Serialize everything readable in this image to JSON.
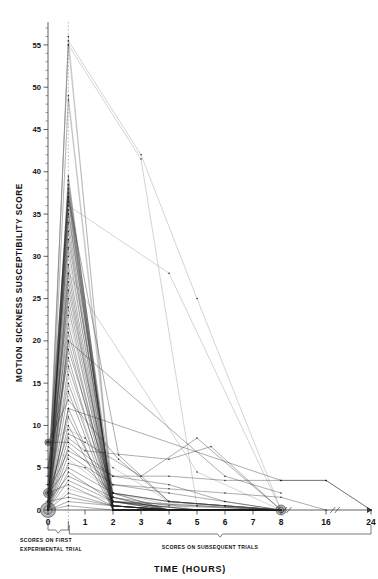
{
  "figure": {
    "axis_title_x": "TIME (HOURS)",
    "axis_title_y": "MOTION SICKNESS SUSCEPTIBILITY SCORE",
    "caption_left_line1": "SCORES ON FIRST",
    "caption_left_line2": "EXPERIMENTAL TRIAL",
    "caption_right": "SCORES ON SUBSEQUENT TRIALS",
    "colors": {
      "ink": "#1d1d1d",
      "light_ink": "#6a6a6a",
      "axis": "#3a3a3a",
      "guide": "#999999"
    }
  },
  "chart_data": {
    "type": "line",
    "title": "",
    "subtitle": "",
    "xlabel": "TIME (HOURS)",
    "ylabel": "MOTION SICKNESS SUSCEPTIBILITY SCORE",
    "grid": false,
    "legend_position": "none",
    "xlim": [
      0,
      24
    ],
    "ylim": [
      0,
      57
    ],
    "ytick_labels": [
      "0",
      "5",
      "10",
      "15",
      "20",
      "25",
      "30",
      "35",
      "40",
      "45",
      "50",
      "55"
    ],
    "yticks": [
      0,
      5,
      10,
      15,
      20,
      25,
      30,
      35,
      40,
      45,
      50,
      55
    ],
    "yminor_step": 1,
    "xtick_labels": [
      "0",
      "1",
      "2",
      "3",
      "4",
      "5",
      "6",
      "7",
      "8",
      "16",
      "24"
    ],
    "xticks": [
      0,
      1,
      2,
      3,
      4,
      5,
      6,
      7,
      8,
      16,
      24
    ],
    "x_axis_breaks": [
      [
        8.6,
        9.4
      ],
      [
        17.2,
        18.0
      ]
    ],
    "first_trial_x": 0.55,
    "annotations": [
      {
        "text": "SCORES ON FIRST EXPERIMENTAL TRIAL",
        "x_from": 0.0,
        "x_to": 0.55
      },
      {
        "text": "SCORES ON SUBSEQUENT TRIALS",
        "x_from": 0.55,
        "x_to": 24.0
      }
    ],
    "series": [
      {
        "name": "S01",
        "x": [
          0,
          0.55,
          2,
          4,
          6,
          8
        ],
        "values": [
          0,
          56,
          0,
          0,
          0,
          0
        ]
      },
      {
        "name": "S02",
        "x": [
          0,
          0.55,
          2,
          4,
          6,
          8
        ],
        "values": [
          1,
          55,
          1,
          0,
          0,
          0
        ]
      },
      {
        "name": "S03",
        "x": [
          0,
          0.55,
          3,
          5,
          8
        ],
        "values": [
          0,
          55.5,
          42,
          25,
          0
        ]
      },
      {
        "name": "S04",
        "x": [
          0,
          0.55,
          3,
          5,
          8
        ],
        "values": [
          2,
          55,
          41.5,
          0.5,
          0
        ]
      },
      {
        "name": "S05",
        "x": [
          0,
          0.55,
          2,
          4,
          8
        ],
        "values": [
          0,
          49,
          2,
          0,
          0
        ]
      },
      {
        "name": "S06",
        "x": [
          0,
          0.55,
          2,
          8
        ],
        "values": [
          0,
          48.5,
          1,
          0
        ]
      },
      {
        "name": "S07",
        "x": [
          0,
          0.55,
          2,
          4,
          6,
          8
        ],
        "values": [
          0,
          39.5,
          0,
          0,
          0,
          0
        ]
      },
      {
        "name": "S08",
        "x": [
          0,
          0.55,
          2,
          5,
          8
        ],
        "values": [
          1,
          39,
          0,
          0,
          0
        ]
      },
      {
        "name": "S09",
        "x": [
          0,
          0.55,
          2,
          4,
          8
        ],
        "values": [
          0,
          38.5,
          1.5,
          0,
          0
        ]
      },
      {
        "name": "S10",
        "x": [
          0,
          0.55,
          2,
          4,
          8
        ],
        "values": [
          3,
          38,
          0,
          0,
          0
        ]
      },
      {
        "name": "S11",
        "x": [
          0,
          0.55,
          2,
          4,
          8
        ],
        "values": [
          0,
          37.5,
          0.5,
          0,
          0
        ]
      },
      {
        "name": "S12",
        "x": [
          0,
          0.55,
          2,
          4,
          6,
          8
        ],
        "values": [
          0,
          37,
          0,
          0,
          0,
          0
        ]
      },
      {
        "name": "S13",
        "x": [
          0,
          0.55,
          2.2,
          4,
          8
        ],
        "values": [
          5,
          37,
          6.5,
          1,
          0
        ]
      },
      {
        "name": "S14",
        "x": [
          0,
          0.55,
          2,
          4,
          8
        ],
        "values": [
          0,
          36.5,
          0,
          0,
          0
        ]
      },
      {
        "name": "S15",
        "x": [
          0,
          0.55,
          4,
          8
        ],
        "values": [
          2,
          36,
          28,
          0
        ]
      },
      {
        "name": "S16",
        "x": [
          0,
          0.55,
          2,
          4,
          8
        ],
        "values": [
          0,
          35.5,
          0.5,
          0,
          0
        ]
      },
      {
        "name": "S17",
        "x": [
          0,
          0.55,
          2,
          5,
          8
        ],
        "values": [
          1,
          35,
          1,
          0,
          0
        ]
      },
      {
        "name": "S18",
        "x": [
          0,
          0.55,
          2,
          4,
          8
        ],
        "values": [
          0,
          34,
          0,
          0,
          0
        ]
      },
      {
        "name": "S19",
        "x": [
          0,
          0.55,
          2,
          4,
          6,
          8
        ],
        "values": [
          0,
          33,
          0,
          0,
          0,
          0
        ]
      },
      {
        "name": "S20",
        "x": [
          0,
          0.55,
          2,
          4,
          8
        ],
        "values": [
          4,
          32,
          1.5,
          0,
          0
        ]
      },
      {
        "name": "S21",
        "x": [
          0,
          0.55,
          2,
          4,
          8
        ],
        "values": [
          0,
          31,
          0,
          0,
          0
        ]
      },
      {
        "name": "S22",
        "x": [
          0,
          0.55,
          2,
          5,
          8
        ],
        "values": [
          2,
          30,
          2,
          0,
          0
        ]
      },
      {
        "name": "S23",
        "x": [
          0,
          0.55,
          2,
          4,
          8
        ],
        "values": [
          0,
          29,
          0.5,
          0,
          0
        ]
      },
      {
        "name": "S24",
        "x": [
          0,
          0.55,
          2,
          4,
          8
        ],
        "values": [
          0,
          28,
          0,
          0,
          0
        ]
      },
      {
        "name": "S25",
        "x": [
          0,
          0.55,
          2,
          4,
          6,
          8
        ],
        "values": [
          1,
          27,
          0,
          0,
          0,
          0
        ]
      },
      {
        "name": "S26",
        "x": [
          0,
          0.55,
          2,
          5,
          8
        ],
        "values": [
          0,
          26,
          1,
          0,
          0
        ]
      },
      {
        "name": "S27",
        "x": [
          0,
          0.55,
          2,
          4,
          8
        ],
        "values": [
          3,
          25,
          0.5,
          0,
          0
        ]
      },
      {
        "name": "S28",
        "x": [
          0,
          0.55,
          2,
          4,
          8
        ],
        "values": [
          0,
          24,
          0,
          0,
          0
        ]
      },
      {
        "name": "S29",
        "x": [
          0,
          0.55,
          2,
          4,
          8
        ],
        "values": [
          0,
          23,
          1,
          0,
          0
        ]
      },
      {
        "name": "S30",
        "x": [
          0,
          0.55,
          2,
          5,
          8
        ],
        "values": [
          2,
          22,
          0,
          0,
          0
        ]
      },
      {
        "name": "S31",
        "x": [
          0,
          0.55,
          2,
          4,
          8
        ],
        "values": [
          0,
          21,
          0.5,
          0,
          0
        ]
      },
      {
        "name": "S32",
        "x": [
          0,
          0.55,
          2,
          4,
          6,
          8
        ],
        "values": [
          1,
          20,
          0,
          0,
          0,
          0
        ]
      },
      {
        "name": "S33",
        "x": [
          0,
          0.55,
          2,
          4,
          8
        ],
        "values": [
          0,
          19,
          2,
          0,
          0
        ]
      },
      {
        "name": "S34",
        "x": [
          0,
          0.55,
          2,
          4,
          8
        ],
        "values": [
          5,
          18,
          0,
          0,
          0
        ]
      },
      {
        "name": "S35",
        "x": [
          0,
          0.55,
          2,
          4,
          8
        ],
        "values": [
          0,
          17,
          1,
          0,
          0
        ]
      },
      {
        "name": "S36",
        "x": [
          0,
          0.55,
          2,
          5,
          8
        ],
        "values": [
          0,
          16,
          0,
          0,
          0
        ]
      },
      {
        "name": "S37",
        "x": [
          0,
          0.55,
          2,
          4,
          8
        ],
        "values": [
          2,
          15,
          0.5,
          0,
          0
        ]
      },
      {
        "name": "S38",
        "x": [
          0,
          0.55,
          2,
          4,
          8
        ],
        "values": [
          0,
          14,
          0,
          0,
          0
        ]
      },
      {
        "name": "S39",
        "x": [
          0,
          0.55,
          2.2,
          4,
          8
        ],
        "values": [
          8,
          13,
          6,
          1,
          0
        ]
      },
      {
        "name": "S40",
        "x": [
          0,
          0.55,
          2,
          4,
          8
        ],
        "values": [
          0,
          12,
          0,
          0,
          0
        ]
      },
      {
        "name": "S41",
        "x": [
          0,
          0.55,
          2,
          5,
          8
        ],
        "values": [
          1,
          11,
          1,
          0,
          0
        ]
      },
      {
        "name": "S42",
        "x": [
          0,
          0.55,
          2,
          4,
          8
        ],
        "values": [
          0,
          10,
          0,
          0,
          0
        ]
      },
      {
        "name": "S43",
        "x": [
          0,
          0.55,
          1,
          2,
          4,
          8
        ],
        "values": [
          8,
          9.5,
          8.5,
          5,
          1,
          0
        ]
      },
      {
        "name": "S44",
        "x": [
          0,
          0.55,
          1,
          3,
          5,
          8
        ],
        "values": [
          2,
          9,
          8,
          4,
          8.5,
          0
        ]
      },
      {
        "name": "S45",
        "x": [
          0,
          0.55,
          1,
          4,
          5.5,
          8
        ],
        "values": [
          0,
          8.5,
          7,
          6,
          7.5,
          0
        ]
      },
      {
        "name": "S46",
        "x": [
          0,
          0.55,
          2,
          4,
          6,
          8
        ],
        "values": [
          8,
          8,
          4,
          3,
          1,
          0
        ]
      },
      {
        "name": "S47",
        "x": [
          0,
          0.55,
          2,
          4,
          6,
          8
        ],
        "values": [
          0,
          7.5,
          3,
          2,
          1,
          0
        ]
      },
      {
        "name": "S48",
        "x": [
          0,
          0.55,
          2,
          4,
          6,
          8,
          16,
          24
        ],
        "values": [
          2,
          7,
          4,
          4,
          3.5,
          3.5,
          3.5,
          0
        ]
      },
      {
        "name": "S49",
        "x": [
          0,
          0.55,
          2,
          4,
          6,
          8,
          16
        ],
        "values": [
          0,
          6.5,
          3,
          2.5,
          2,
          1.5,
          0
        ]
      },
      {
        "name": "S50",
        "x": [
          0,
          0.55,
          2,
          4,
          6,
          8
        ],
        "values": [
          8,
          6,
          2,
          1,
          0.5,
          0
        ]
      },
      {
        "name": "S51",
        "x": [
          0,
          0.55,
          1,
          2,
          4,
          8
        ],
        "values": [
          0,
          5.5,
          5,
          2,
          1,
          0
        ]
      },
      {
        "name": "S52",
        "x": [
          0,
          0.55,
          2,
          4,
          6,
          8
        ],
        "values": [
          2,
          5,
          2,
          1,
          0.5,
          0
        ]
      },
      {
        "name": "S53",
        "x": [
          0,
          0.55,
          2,
          5,
          8
        ],
        "values": [
          0,
          4.5,
          1,
          0.5,
          0
        ]
      },
      {
        "name": "S54",
        "x": [
          0,
          0.55,
          2,
          4,
          8
        ],
        "values": [
          1,
          4,
          1.5,
          0.5,
          0
        ]
      },
      {
        "name": "S55",
        "x": [
          0,
          0.55,
          2,
          4,
          8
        ],
        "values": [
          0,
          3.5,
          1,
          0,
          0
        ]
      },
      {
        "name": "S56",
        "x": [
          0,
          0.55,
          2,
          4,
          8
        ],
        "values": [
          2,
          3,
          0.5,
          0,
          0
        ]
      },
      {
        "name": "S57",
        "x": [
          0,
          0.55,
          2,
          6,
          8
        ],
        "values": [
          0,
          2.5,
          1,
          0.5,
          0
        ]
      },
      {
        "name": "S58",
        "x": [
          0,
          0.55,
          2,
          4,
          8
        ],
        "values": [
          0,
          2,
          0.5,
          0,
          0
        ]
      },
      {
        "name": "S59",
        "x": [
          0,
          0.55,
          2,
          4,
          8
        ],
        "values": [
          1,
          1.5,
          0.5,
          0,
          0
        ]
      },
      {
        "name": "S60",
        "x": [
          0,
          0.55,
          2,
          4,
          6,
          8
        ],
        "values": [
          0,
          1,
          0.5,
          0,
          0,
          0
        ]
      },
      {
        "name": "S61",
        "x": [
          0,
          0.55,
          2,
          4,
          6,
          8
        ],
        "values": [
          0,
          0.5,
          0,
          0,
          0,
          0
        ]
      },
      {
        "name": "S62",
        "x": [
          0,
          0.55,
          8,
          16,
          24
        ],
        "values": [
          0,
          12,
          3.5,
          3.5,
          0
        ]
      },
      {
        "name": "S63",
        "x": [
          0,
          0.55,
          6,
          8
        ],
        "values": [
          0,
          20,
          4,
          2
        ]
      },
      {
        "name": "S64",
        "x": [
          0,
          0.55,
          5,
          8
        ],
        "values": [
          0,
          28,
          4.5,
          0
        ]
      }
    ],
    "clusters": [
      {
        "x": 0,
        "y": 0,
        "count_radius": 7.5,
        "note": "many coincident zero scores at baseline"
      },
      {
        "x": 0,
        "y": 2,
        "count_radius": 4.5,
        "note": "coincident baseline scores"
      },
      {
        "x": 0,
        "y": 8,
        "count_radius": 3.2,
        "note": "coincident baseline scores"
      },
      {
        "x": 8,
        "y": 0,
        "count_radius": 5.0,
        "note": "many coincident zero scores at 8 hours"
      }
    ]
  }
}
